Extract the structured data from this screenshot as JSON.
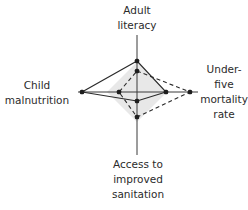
{
  "chart_data": {
    "type": "radar",
    "title": "",
    "axes": [
      "Adult literacy",
      "Under-five mortality rate",
      "Access to improved sanitation",
      "Child malnutrition"
    ],
    "axis_labels_lines": {
      "top": [
        "Adult",
        "literacy"
      ],
      "right": [
        "Under-",
        "five",
        "mortality",
        "rate"
      ],
      "bottom": [
        "Access to",
        "improved",
        "sanitation"
      ],
      "left": [
        "Child",
        "malnutrition"
      ]
    },
    "range": [
      0,
      1
    ],
    "series": [
      {
        "name": "solid",
        "style": "solid",
        "values": {
          "Adult literacy": 0.52,
          "Under-five mortality rate": 0.48,
          "Access to improved sanitation": 0.15,
          "Child malnutrition": 0.92
        }
      },
      {
        "name": "dashed",
        "style": "dashed",
        "values": {
          "Adult literacy": 0.35,
          "Under-five mortality rate": 0.88,
          "Access to improved sanitation": 0.42,
          "Child malnutrition": 0.3
        }
      }
    ],
    "shaded_reference_area": "light grey diamond near center",
    "grid": false,
    "legend": "none"
  },
  "geometry": {
    "center": [
      137,
      92
    ],
    "axis_extent": {
      "top": 35,
      "bottom": 155,
      "left": 78,
      "right": 198
    },
    "solid_points": "137,61 166,92 137,101 82,92",
    "dashed_points": "137,71 190,92 137,117 119,92",
    "shade_points": "137,62 167,92 137,122 107,92"
  },
  "colors": {
    "line": "#2a2a2a",
    "shade": "#e6e6e6"
  }
}
